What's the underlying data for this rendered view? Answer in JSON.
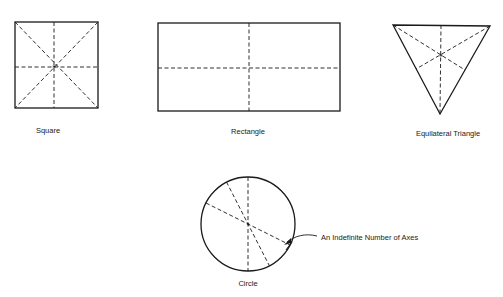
{
  "diagram": {
    "shapes": [
      {
        "id": "square",
        "label": "Square",
        "axes": 4
      },
      {
        "id": "rectangle",
        "label": "Rectangle",
        "axes": 2
      },
      {
        "id": "triangle",
        "label": "Equilateral Triangle",
        "axes": 3
      },
      {
        "id": "circle",
        "label": "Circle",
        "axes": "indefinite"
      }
    ],
    "annotation": "An Indefinite Number of Axes",
    "colors": {
      "line": "#1a1a1a",
      "background": "#ffffff"
    }
  }
}
